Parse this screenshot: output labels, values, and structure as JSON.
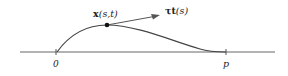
{
  "diagram": {
    "colors": {
      "stroke": "#444444",
      "text": "#222222",
      "background": "#ffffff"
    },
    "axis": {
      "y": 52,
      "x_start": 20,
      "x_end": 275
    },
    "ticks": [
      {
        "label": "0",
        "x": 56
      },
      {
        "label": "p",
        "x": 226
      }
    ],
    "curve": {
      "start": [
        57,
        52
      ],
      "peak_point": [
        107,
        25
      ],
      "end": [
        218,
        52
      ]
    },
    "point": {
      "label_bold": "x",
      "label_args": "(s,t)",
      "x": 107,
      "y": 25
    },
    "tangent": {
      "label_prefix": "τ",
      "label_bold": "t",
      "label_args": "(s)",
      "tip": [
        160,
        15
      ]
    }
  }
}
